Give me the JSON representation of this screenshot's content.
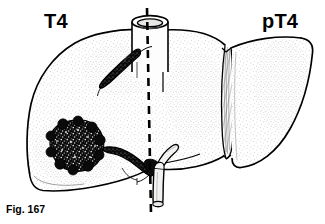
{
  "figure": {
    "caption": "Fig. 167",
    "labels": {
      "left_stage": "T4",
      "right_stage": "pT4"
    },
    "colors": {
      "ink": "#000000",
      "background": "#ffffff",
      "tumor_fill": "#111111",
      "parenchyma_stipple": "#9a9a9a",
      "vessel_light_fill": "#f2f2f0"
    },
    "midline": {
      "style": "dashed",
      "top_x": 147,
      "top_y": 8,
      "bottom_x": 151,
      "bottom_y": 214
    },
    "structures": [
      {
        "name": "inferior-vena-cava",
        "appearance": "open cylinder at superior margin"
      },
      {
        "name": "left-lobe",
        "appearance": "large stippled lobe"
      },
      {
        "name": "right-lobe",
        "appearance": "crescent wedge lobe"
      },
      {
        "name": "falciform-fissure",
        "appearance": "hatched vertical band"
      },
      {
        "name": "tumor-nodule",
        "appearance": "dark nodular mass in left lobe"
      },
      {
        "name": "hepatic-vein-invasion",
        "appearance": "black elongated vessel superior"
      },
      {
        "name": "portal-vein-invasion",
        "appearance": "black branching vessel at hilum"
      },
      {
        "name": "bile-duct",
        "appearance": "pale Y-shaped duct descending from hilum"
      }
    ]
  }
}
